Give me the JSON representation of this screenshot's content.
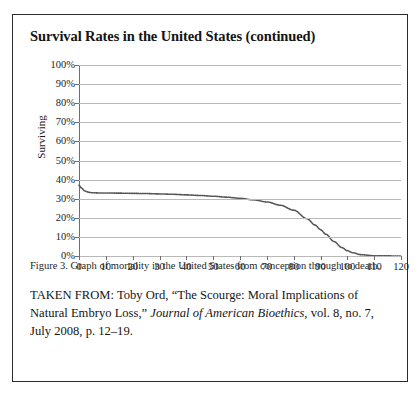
{
  "figure": {
    "title": "Survival Rates in the United States (continued)",
    "caption": "Figure 3. Graph of mortality in the United States from conception through to death.",
    "source": {
      "prefix": "TAKEN FROM: Toby Ord, “The Scourge: Moral Implications of Natural Embryo Loss,” ",
      "journal": "Journal of American Bioethics",
      "suffix": ", vol. 8, no. 7, July 2008, p. 12–19."
    }
  },
  "colors": {
    "frame": "#2b2b2b",
    "gridline": "#b9b9b9",
    "axis": "#6e6e6e",
    "curve": "#555555",
    "text": "#1a1a1a"
  },
  "chart_data": {
    "type": "line",
    "title": "",
    "xlabel": "",
    "ylabel": "Surviving",
    "xlim": [
      0,
      120
    ],
    "ylim": [
      0,
      100
    ],
    "grid": true,
    "legend": null,
    "line_style": "dotted",
    "x_ticks": [
      0,
      10,
      20,
      30,
      40,
      50,
      60,
      70,
      80,
      90,
      100,
      110,
      120
    ],
    "x_tick_labels": [
      "0",
      "10",
      "20",
      "30",
      "40",
      "50",
      "60",
      "70",
      "80",
      "90",
      "100",
      "110",
      "120"
    ],
    "y_ticks": [
      0,
      10,
      20,
      30,
      40,
      50,
      60,
      70,
      80,
      90,
      100
    ],
    "y_tick_labels": [
      "0%",
      "10%",
      "20%",
      "30%",
      "40%",
      "50%",
      "60%",
      "70%",
      "80%",
      "90%",
      "100%"
    ],
    "x": [
      0,
      1,
      2,
      3,
      4,
      5,
      8,
      10,
      15,
      20,
      25,
      30,
      35,
      40,
      45,
      50,
      55,
      60,
      65,
      70,
      75,
      80,
      85,
      88,
      90,
      92,
      95,
      98,
      100,
      102,
      105,
      110,
      115,
      120
    ],
    "y": [
      37,
      35.5,
      34.2,
      33.6,
      33.3,
      33.1,
      33.0,
      33.0,
      32.9,
      32.8,
      32.7,
      32.5,
      32.3,
      32.0,
      31.7,
      31.3,
      30.8,
      30.2,
      29.4,
      28.3,
      26.6,
      24.0,
      19.5,
      16.2,
      13.8,
      11.4,
      7.6,
      4.4,
      2.8,
      1.7,
      0.7,
      0.15,
      0.05,
      0.0
    ],
    "series_name": "Surviving"
  }
}
